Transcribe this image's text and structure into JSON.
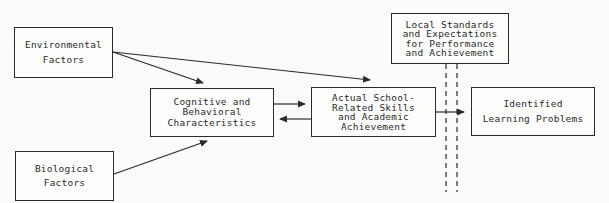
{
  "diagram": {
    "nodes": {
      "environmental": {
        "lines": [
          "Environmental",
          "Factors"
        ]
      },
      "biological": {
        "lines": [
          "Biological",
          "Factors"
        ]
      },
      "cognitive": {
        "lines": [
          "Cognitive and",
          "Behavioral",
          "Characteristics"
        ]
      },
      "actual": {
        "lines": [
          "Actual School-",
          "Related Skills",
          "and Academic",
          "Achievement"
        ]
      },
      "standards": {
        "lines": [
          "Local Standards",
          "and Expectations",
          "for Performance",
          "and Achievement"
        ]
      },
      "identified": {
        "lines": [
          "Identified",
          "Learning Problems"
        ]
      }
    },
    "edges": [
      {
        "from": "Environmental Factors",
        "to": "Cognitive and Behavioral Characteristics"
      },
      {
        "from": "Environmental Factors",
        "to": "Actual School-Related Skills and Academic Achievement"
      },
      {
        "from": "Biological Factors",
        "to": "Cognitive and Behavioral Characteristics"
      },
      {
        "from": "Cognitive and Behavioral Characteristics",
        "to": "Actual School-Related Skills and Academic Achievement"
      },
      {
        "from": "Actual School-Related Skills and Academic Achievement",
        "to": "Cognitive and Behavioral Characteristics"
      },
      {
        "from": "Actual School-Related Skills and Academic Achievement",
        "to": "Identified Learning Problems",
        "crosses": "Local Standards and Expectations for Performance and Achievement (dashed filter)"
      }
    ],
    "colors": {
      "line": "#2a2a2a",
      "background": "#fbfbfa"
    }
  }
}
